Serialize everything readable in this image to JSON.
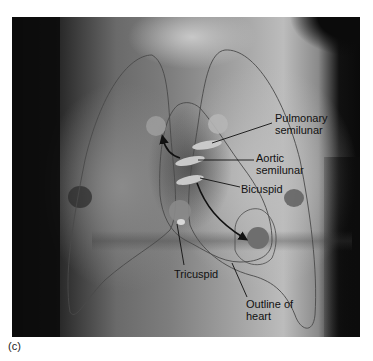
{
  "figure": {
    "panel_label": "(c)"
  },
  "labels": {
    "pulmonary": "Pulmonary\nsemilunar",
    "pulmonary_line1": "Pulmonary",
    "pulmonary_line2": "semilunar",
    "aortic_line1": "Aortic",
    "aortic_line2": "semilunar",
    "bicuspid": "Bicuspid",
    "tricuspid": "Tricuspid",
    "outline_line1": "Outline of",
    "outline_line2": "heart"
  },
  "colors": {
    "circle_light": "#9e9e9e",
    "circle_dark": "#6e6e6e",
    "valve_ellipse": "#c9c9c9",
    "outline_stroke": "#4a4a4a",
    "arrow": "#111111"
  }
}
